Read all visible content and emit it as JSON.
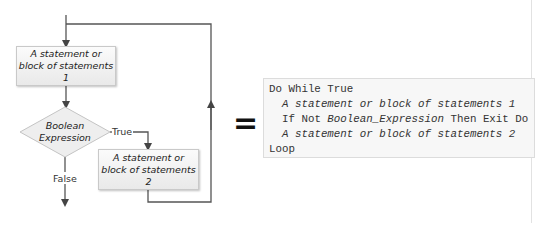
{
  "flowchart": {
    "box1": {
      "lines": [
        "A statement or",
        "block of statements",
        "1"
      ]
    },
    "decision": {
      "lines": [
        "Boolean",
        "Expression"
      ]
    },
    "box2": {
      "lines": [
        "A statement or",
        "block of statements",
        "2"
      ]
    },
    "true_label": "True",
    "false_label": "False",
    "colors": {
      "line": "#444444",
      "box_border": "#c9c9c9",
      "box_fill": "#f2f2f2"
    }
  },
  "equals_sign": "=",
  "code": {
    "lines": [
      {
        "text": "Do While True",
        "indent": false
      },
      {
        "text": "A statement or block of statements 1",
        "indent": true,
        "italic": true
      },
      {
        "prefix": "If Not ",
        "italic_part": "Boolean_Expression",
        "suffix": " Then Exit Do",
        "indent": true
      },
      {
        "text": "A statement or block of statements 2",
        "indent": true,
        "italic": true
      },
      {
        "text": "Loop",
        "indent": false
      }
    ],
    "line0": "Do While True",
    "line1": "A statement or block of statements 1",
    "line2_prefix": "If Not ",
    "line2_italic": "Boolean_Expression",
    "line2_suffix": " Then Exit Do",
    "line3": "A statement or block of statements 2",
    "line4": "Loop"
  }
}
